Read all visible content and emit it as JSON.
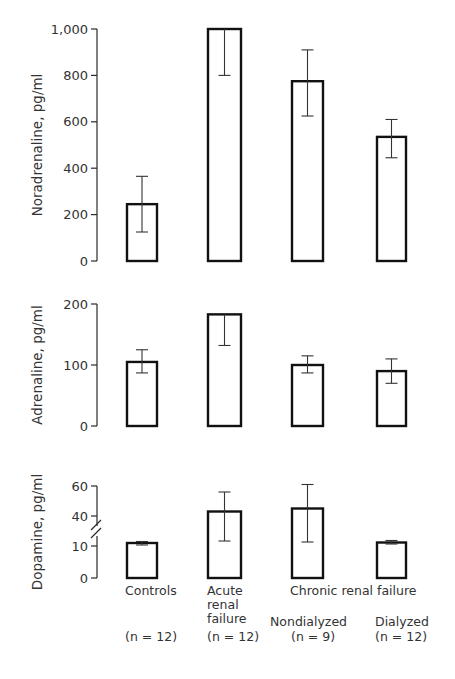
{
  "figure": {
    "categories": [
      "Controls",
      "Acute renal failure",
      "Nondialyzed",
      "Dialyzed"
    ],
    "group_label": "Chronic renal failure",
    "x_labels": [
      {
        "lines": [
          "Controls"
        ],
        "n": "(n = 12)"
      },
      {
        "lines": [
          "Acute",
          "renal",
          "failure"
        ],
        "n": "(n = 12)"
      },
      {
        "lines": [
          "Nondialyzed"
        ],
        "n": "(n = 9)"
      },
      {
        "lines": [
          "Dialyzed"
        ],
        "n": "(n = 12)"
      }
    ]
  },
  "chart_data": [
    {
      "type": "bar",
      "title": "",
      "ylabel": "Noradrenaline, pg/ml",
      "xlabel": "",
      "categories": [
        "Controls",
        "Acute renal failure",
        "Chronic renal failure – Nondialyzed",
        "Chronic renal failure – Dialyzed"
      ],
      "values": [
        245,
        1000,
        775,
        535
      ],
      "error_low": [
        125,
        800,
        625,
        445
      ],
      "error_high": [
        365,
        1000,
        910,
        610
      ],
      "ylim": [
        0,
        1000
      ],
      "yticks": [
        0,
        200,
        400,
        600,
        800,
        1000
      ],
      "ytick_labels": [
        "0",
        "200",
        "400",
        "600",
        "800",
        "1,000"
      ],
      "grid": false
    },
    {
      "type": "bar",
      "title": "",
      "ylabel": "Adrenaline, pg/ml",
      "xlabel": "",
      "categories": [
        "Controls",
        "Acute renal failure",
        "Chronic renal failure – Nondialyzed",
        "Chronic renal failure – Dialyzed"
      ],
      "values": [
        105,
        183,
        100,
        90
      ],
      "error_low": [
        87,
        132,
        87,
        70
      ],
      "error_high": [
        125,
        183,
        115,
        110
      ],
      "ylim": [
        0,
        200
      ],
      "yticks": [
        0,
        100,
        200
      ],
      "ytick_labels": [
        "0",
        "100",
        "200"
      ],
      "grid": false
    },
    {
      "type": "bar",
      "title": "",
      "ylabel": "Dopamine, pg/ml",
      "xlabel": "Controls (n = 12); Acute renal failure (n = 12); Chronic renal failure: Nondialyzed (n = 9), Dialyzed (n = 12)",
      "categories": [
        "Controls",
        "Acute renal failure",
        "Chronic renal failure – Nondialyzed",
        "Chronic renal failure – Dialyzed"
      ],
      "values": [
        13,
        43,
        45,
        13.5
      ],
      "error_low": [
        11,
        15,
        14,
        12
      ],
      "error_high": [
        14.5,
        56,
        61,
        15.5
      ],
      "ylim": [
        0,
        60
      ],
      "axis_break": [
        10,
        40
      ],
      "yticks": [
        0,
        10,
        40,
        60
      ],
      "ytick_labels": [
        "0",
        "10",
        "40",
        "60"
      ],
      "grid": false
    }
  ],
  "layout": {
    "axis_x": 97,
    "bar_x": [
      127,
      208,
      292,
      377
    ],
    "bar_w": [
      30,
      33,
      31,
      29
    ],
    "panels": [
      {
        "y_top": 29,
        "y_zero": 261,
        "vmax": 1000
      },
      {
        "y_top": 304,
        "y_zero": 426,
        "vmax": 200
      },
      {
        "y_zero": 578,
        "seg_low": {
          "v0": 0,
          "v1": 10,
          "y0": 578,
          "y1": 546
        },
        "seg_high": {
          "v0": 40,
          "v1": 60,
          "y0": 516,
          "y1": 486
        }
      }
    ]
  }
}
